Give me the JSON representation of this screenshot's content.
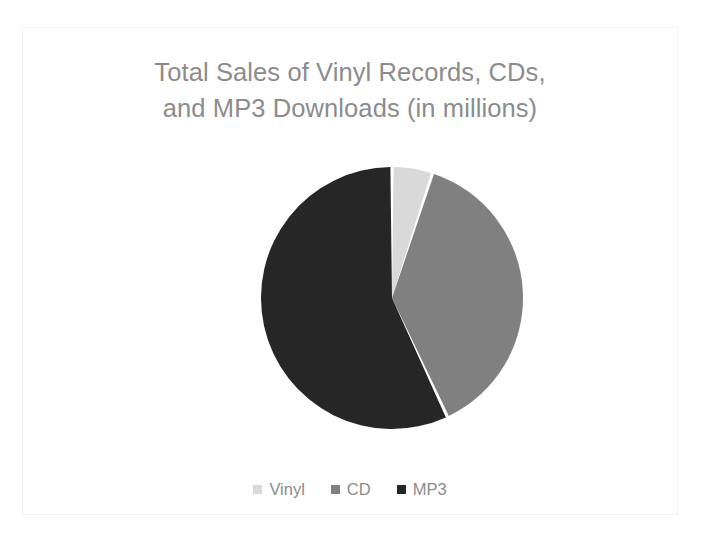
{
  "chart": {
    "title": "Total Sales of Vinyl Records, CDs,\nand MP3 Downloads (in millions)",
    "title_line1": "Total Sales of Vinyl Records, CDs,",
    "title_line2": "and MP3 Downloads (in millions)",
    "title_color": "#8c8c8c",
    "background_color": "#ffffff",
    "border_color": "#f2f2f2"
  },
  "legend": {
    "position": "bottom",
    "items": [
      {
        "label": "Vinyl",
        "color": "#d9d9d9",
        "swatch_name": "legend-swatch-vinyl"
      },
      {
        "label": "CD",
        "color": "#808080",
        "swatch_name": "legend-swatch-cd"
      },
      {
        "label": "MP3",
        "color": "#262626",
        "swatch_name": "legend-swatch-mp3"
      }
    ]
  },
  "chart_data": {
    "type": "pie",
    "title": "Total Sales of Vinyl Records, CDs, and MP3 Downloads (in millions)",
    "xlabel": "",
    "ylabel": "",
    "grid": false,
    "legend_position": "bottom",
    "start_angle_deg": 0,
    "direction": "clockwise",
    "categories": [
      "Vinyl",
      "CD",
      "MP3"
    ],
    "values": [
      5,
      38,
      57
    ],
    "unit": "percent",
    "colors": [
      "#d9d9d9",
      "#808080",
      "#262626"
    ],
    "slices": [
      {
        "label": "Vinyl",
        "value": 5,
        "percent": 5,
        "color": "#d9d9d9",
        "start_deg": 0,
        "end_deg": 18
      },
      {
        "label": "CD",
        "value": 38,
        "percent": 38,
        "color": "#808080",
        "start_deg": 18,
        "end_deg": 155
      },
      {
        "label": "MP3",
        "value": 57,
        "percent": 57,
        "color": "#262626",
        "start_deg": 155,
        "end_deg": 360
      }
    ]
  },
  "geometry": {
    "center_x": 155,
    "center_y": 145,
    "radius": 131,
    "gap_deg": 1.4
  }
}
